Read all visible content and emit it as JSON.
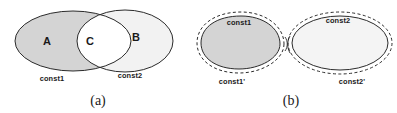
{
  "figure": {
    "width": 397,
    "height": 113,
    "background_color": "#ffffff",
    "stroke_color": "#2b2b2b",
    "text_color": "#1a1a1a"
  },
  "panel_a": {
    "caption": "(a)",
    "regions": [
      {
        "id": "A",
        "label": "A",
        "fill_color": "#d4d4d4",
        "description": "left-only region"
      },
      {
        "id": "C",
        "label": "C",
        "fill_color": "#ffffff",
        "description": "intersection region"
      },
      {
        "id": "B",
        "label": "B",
        "fill_color": "#f2f2f2",
        "description": "right-only region"
      }
    ],
    "constraints": [
      {
        "id": "const1",
        "label": "const1",
        "side": "left"
      },
      {
        "id": "const2",
        "label": "const2",
        "side": "right"
      }
    ]
  },
  "panel_b": {
    "caption": "(b)",
    "shapes": [
      {
        "id": "left",
        "inner_label": "const1",
        "outer_label": "const1'",
        "fill_color": "#d4d4d4",
        "inner_style": "solid",
        "outer_style": "dashed"
      },
      {
        "id": "right",
        "inner_label": "const2",
        "outer_label": "const2'",
        "fill_color": "#f2f2f2",
        "inner_style": "solid",
        "outer_style": "dashed"
      }
    ]
  }
}
